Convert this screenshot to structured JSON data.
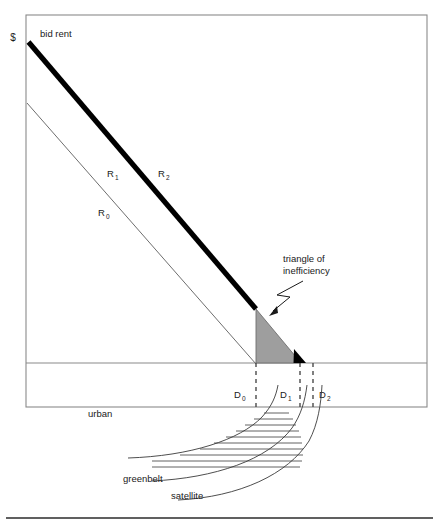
{
  "figure": {
    "axis_label_y": "$",
    "caption_top": "bid rent"
  },
  "curves": {
    "r0_label": "R",
    "r0_sub": "0",
    "r1_label": "R",
    "r1_sub": "1",
    "r2_label": "R",
    "r2_sub": "2"
  },
  "annotations": {
    "triangle_line1": "triangle of",
    "triangle_line2": "inefficiency"
  },
  "distances": [
    {
      "label": "D",
      "sub": "0"
    },
    {
      "label": "D",
      "sub": "1"
    },
    {
      "label": "D",
      "sub": "2"
    }
  ],
  "zones": {
    "urban": "urban",
    "greenbelt": "greenbelt",
    "satellite": "satellite"
  },
  "colors": {
    "frame": "#8a8a8a",
    "thin_line": "#6e6e6e",
    "bold_line": "#000000",
    "triangle_fill": "#9e9e9e",
    "triangle_stroke": "#6e6e6e",
    "text": "#1a1a1a",
    "background": "#ffffff",
    "rule": "#2b2b2b"
  },
  "geometry": {
    "frame": {
      "x": 26,
      "y": 15,
      "w": 401,
      "h": 392
    },
    "axis_y": 363,
    "d0_x": 255,
    "d1_x": 300,
    "d2_x": 313
  }
}
